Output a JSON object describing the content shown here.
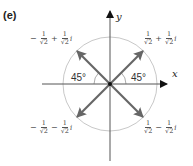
{
  "panel_label": "(e)",
  "axes": {
    "x_label": "x",
    "y_label": "y"
  },
  "angles": {
    "left": "45°",
    "right": "45°"
  },
  "points": {
    "upper_left": {
      "sign_real": "−",
      "num_real": "1",
      "den_real": "√2",
      "op": "+",
      "num_imag": "1",
      "den_imag": "√2",
      "unit": "i"
    },
    "upper_right": {
      "sign_real": "",
      "num_real": "1",
      "den_real": "√2",
      "op": "+",
      "num_imag": "1",
      "den_imag": "√2",
      "unit": "i"
    },
    "lower_left": {
      "sign_real": "−",
      "num_real": "1",
      "den_real": "√2",
      "op": "−",
      "num_imag": "1",
      "den_imag": "√2",
      "unit": "i"
    },
    "lower_right": {
      "sign_real": "",
      "num_real": "1",
      "den_real": "√2",
      "op": "−",
      "num_imag": "1",
      "den_imag": "√2",
      "unit": "i"
    }
  },
  "colors": {
    "arrow": "#666666",
    "circle": "#c8c8c8",
    "axis": "#555555"
  }
}
